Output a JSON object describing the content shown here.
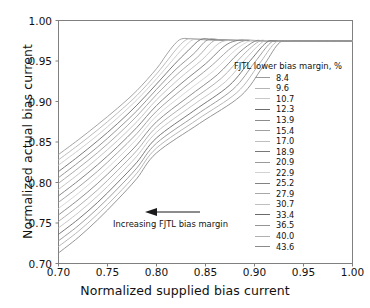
{
  "chart_data": {
    "type": "line",
    "title": "",
    "xlabel": "Normalized supplied bias current",
    "ylabel": "Normalized actual bias current",
    "xlim": [
      0.7,
      1.0
    ],
    "ylim": [
      0.7,
      1.0
    ],
    "xticks": [
      "0.70",
      "0.75",
      "0.80",
      "0.85",
      "0.90",
      "0.95",
      "1.00"
    ],
    "yticks": [
      "0.70",
      "0.75",
      "0.80",
      "0.85",
      "0.90",
      "0.95",
      "1.00"
    ],
    "xtick_values": [
      0.7,
      0.75,
      0.8,
      0.85,
      0.9,
      0.95,
      1.0
    ],
    "ytick_values": [
      0.7,
      0.75,
      0.8,
      0.85,
      0.9,
      0.95,
      1.0
    ],
    "grid": false,
    "legend_position": "inside-right",
    "legend_title": "FJTL lower bias margin, %",
    "annotations": [
      {
        "text": "Increasing FJTL bias margin",
        "arrow": "left-arrow",
        "x": 0.835,
        "y": 0.762
      }
    ],
    "series": [
      {
        "name": "8.4",
        "color": "#9a9a9a",
        "x": [
          0.7,
          0.72,
          0.74,
          0.76,
          0.78,
          0.8,
          0.81,
          0.818,
          0.826,
          0.84,
          0.86,
          0.9,
          0.95,
          1.0
        ],
        "y": [
          0.8345,
          0.8525,
          0.8715,
          0.8915,
          0.9135,
          0.9405,
          0.9575,
          0.97,
          0.9775,
          0.9768,
          0.9757,
          0.9752,
          0.975,
          0.9748
        ]
      },
      {
        "name": "9.6",
        "color": "#b4b4b4",
        "x": [
          0.7,
          0.72,
          0.74,
          0.76,
          0.78,
          0.8,
          0.812,
          0.822,
          0.832,
          0.845,
          0.865,
          0.9,
          0.95,
          1.0
        ],
        "y": [
          0.828,
          0.846,
          0.865,
          0.8855,
          0.9075,
          0.934,
          0.952,
          0.967,
          0.9772,
          0.9768,
          0.9757,
          0.9752,
          0.975,
          0.9748
        ]
      },
      {
        "name": "10.7",
        "color": "#c8c8c8",
        "x": [
          0.7,
          0.72,
          0.74,
          0.76,
          0.78,
          0.8,
          0.815,
          0.827,
          0.838,
          0.852,
          0.87,
          0.905,
          0.95,
          1.0
        ],
        "y": [
          0.8215,
          0.8395,
          0.8585,
          0.8795,
          0.902,
          0.928,
          0.949,
          0.9655,
          0.9768,
          0.9766,
          0.9756,
          0.9752,
          0.975,
          0.9748
        ]
      },
      {
        "name": "12.3",
        "color": "#6e6e6e",
        "x": [
          0.7,
          0.72,
          0.74,
          0.76,
          0.78,
          0.8,
          0.818,
          0.832,
          0.845,
          0.858,
          0.875,
          0.908,
          0.95,
          1.0
        ],
        "y": [
          0.8135,
          0.832,
          0.8515,
          0.8725,
          0.8955,
          0.9215,
          0.9455,
          0.9625,
          0.9765,
          0.9764,
          0.9755,
          0.9751,
          0.975,
          0.9748
        ]
      },
      {
        "name": "13.9",
        "color": "#8c8c8c",
        "x": [
          0.7,
          0.72,
          0.74,
          0.76,
          0.78,
          0.8,
          0.82,
          0.838,
          0.852,
          0.866,
          0.882,
          0.912,
          0.952,
          1.0
        ],
        "y": [
          0.806,
          0.8245,
          0.844,
          0.8655,
          0.8885,
          0.915,
          0.94,
          0.959,
          0.976,
          0.9762,
          0.9754,
          0.9751,
          0.975,
          0.9748
        ]
      },
      {
        "name": "15.4",
        "color": "#a0a0a0",
        "x": [
          0.7,
          0.72,
          0.74,
          0.76,
          0.78,
          0.8,
          0.822,
          0.842,
          0.858,
          0.872,
          0.888,
          0.916,
          0.955,
          1.0
        ],
        "y": [
          0.799,
          0.8175,
          0.837,
          0.8585,
          0.882,
          0.9085,
          0.9345,
          0.955,
          0.9745,
          0.976,
          0.9754,
          0.9751,
          0.975,
          0.9748
        ]
      },
      {
        "name": "17.0",
        "color": "#bebebe",
        "x": [
          0.7,
          0.72,
          0.74,
          0.76,
          0.78,
          0.8,
          0.824,
          0.846,
          0.864,
          0.878,
          0.894,
          0.92,
          0.958,
          1.0
        ],
        "y": [
          0.7915,
          0.81,
          0.83,
          0.8515,
          0.875,
          0.902,
          0.929,
          0.951,
          0.972,
          0.9757,
          0.9753,
          0.9751,
          0.975,
          0.9748
        ]
      },
      {
        "name": "18.9",
        "color": "#787878",
        "x": [
          0.7,
          0.72,
          0.74,
          0.76,
          0.78,
          0.8,
          0.826,
          0.85,
          0.87,
          0.884,
          0.898,
          0.924,
          0.96,
          1.0
        ],
        "y": [
          0.7835,
          0.802,
          0.822,
          0.844,
          0.868,
          0.895,
          0.923,
          0.9465,
          0.969,
          0.9756,
          0.9753,
          0.9751,
          0.975,
          0.9748
        ]
      },
      {
        "name": "20.9",
        "color": "#9a9a9a",
        "x": [
          0.7,
          0.72,
          0.74,
          0.76,
          0.78,
          0.8,
          0.828,
          0.854,
          0.876,
          0.89,
          0.902,
          0.928,
          0.962,
          1.0
        ],
        "y": [
          0.7755,
          0.794,
          0.814,
          0.8365,
          0.8605,
          0.888,
          0.917,
          0.942,
          0.966,
          0.9752,
          0.9752,
          0.975,
          0.975,
          0.9748
        ]
      },
      {
        "name": "22.9",
        "color": "#d2d2d2",
        "x": [
          0.7,
          0.72,
          0.74,
          0.76,
          0.78,
          0.8,
          0.83,
          0.858,
          0.88,
          0.895,
          0.906,
          0.932,
          0.965,
          1.0
        ],
        "y": [
          0.768,
          0.7865,
          0.807,
          0.8295,
          0.854,
          0.882,
          0.9115,
          0.9375,
          0.963,
          0.9748,
          0.9751,
          0.975,
          0.975,
          0.9748
        ]
      },
      {
        "name": "25.2",
        "color": "#828282",
        "x": [
          0.7,
          0.72,
          0.74,
          0.76,
          0.78,
          0.8,
          0.832,
          0.862,
          0.884,
          0.9,
          0.91,
          0.936,
          0.968,
          1.0
        ],
        "y": [
          0.76,
          0.7785,
          0.799,
          0.822,
          0.8465,
          0.875,
          0.9055,
          0.933,
          0.96,
          0.9742,
          0.975,
          0.9749,
          0.9749,
          0.9748
        ]
      },
      {
        "name": "27.9",
        "color": "#a8a8a8",
        "x": [
          0.7,
          0.72,
          0.74,
          0.76,
          0.78,
          0.8,
          0.834,
          0.866,
          0.888,
          0.904,
          0.914,
          0.94,
          0.97,
          1.0
        ],
        "y": [
          0.752,
          0.7705,
          0.791,
          0.8145,
          0.8395,
          0.8685,
          0.9,
          0.9285,
          0.957,
          0.9738,
          0.9752,
          0.9749,
          0.9749,
          0.9748
        ]
      },
      {
        "name": "30.7",
        "color": "#c0c0c0",
        "x": [
          0.7,
          0.72,
          0.74,
          0.76,
          0.78,
          0.8,
          0.836,
          0.87,
          0.892,
          0.908,
          0.918,
          0.944,
          0.972,
          1.0
        ],
        "y": [
          0.744,
          0.7625,
          0.7835,
          0.807,
          0.8325,
          0.862,
          0.8945,
          0.924,
          0.954,
          0.9732,
          0.975,
          0.9749,
          0.9749,
          0.9748
        ]
      },
      {
        "name": "33.4",
        "color": "#6a6a6a",
        "x": [
          0.7,
          0.72,
          0.74,
          0.76,
          0.78,
          0.8,
          0.838,
          0.874,
          0.896,
          0.912,
          0.922,
          0.948,
          0.975,
          1.0
        ],
        "y": [
          0.736,
          0.7545,
          0.7755,
          0.7995,
          0.825,
          0.855,
          0.8885,
          0.9195,
          0.951,
          0.9726,
          0.9749,
          0.9748,
          0.9748,
          0.9748
        ]
      },
      {
        "name": "36.5",
        "color": "#949494",
        "x": [
          0.7,
          0.72,
          0.74,
          0.76,
          0.78,
          0.8,
          0.84,
          0.878,
          0.9,
          0.916,
          0.926,
          0.952,
          0.977,
          1.0
        ],
        "y": [
          0.728,
          0.7465,
          0.768,
          0.792,
          0.818,
          0.8485,
          0.883,
          0.915,
          0.948,
          0.972,
          0.9748,
          0.9748,
          0.9748,
          0.9748
        ]
      },
      {
        "name": "40.0",
        "color": "#b0b0b0",
        "x": [
          0.7,
          0.72,
          0.74,
          0.76,
          0.78,
          0.8,
          0.842,
          0.882,
          0.904,
          0.92,
          0.93,
          0.956,
          0.98,
          1.0
        ],
        "y": [
          0.721,
          0.7395,
          0.761,
          0.785,
          0.8115,
          0.8425,
          0.878,
          0.911,
          0.945,
          0.9714,
          0.9747,
          0.9747,
          0.9748,
          0.9748
        ]
      },
      {
        "name": "43.6",
        "color": "#8a8a8a",
        "x": [
          0.7,
          0.72,
          0.74,
          0.76,
          0.78,
          0.8,
          0.844,
          0.886,
          0.908,
          0.924,
          0.934,
          0.96,
          0.982,
          1.0
        ],
        "y": [
          0.713,
          0.732,
          0.754,
          0.7785,
          0.805,
          0.8365,
          0.873,
          0.907,
          0.942,
          0.9708,
          0.9746,
          0.9747,
          0.9748,
          0.9748
        ]
      }
    ]
  },
  "legend": {
    "title": "FJTL lower bias margin, %",
    "entries": [
      {
        "label": "8.4",
        "color": "#9a9a9a"
      },
      {
        "label": "9.6",
        "color": "#b4b4b4"
      },
      {
        "label": "10.7",
        "color": "#c8c8c8"
      },
      {
        "label": "12.3",
        "color": "#6e6e6e"
      },
      {
        "label": "13.9",
        "color": "#8c8c8c"
      },
      {
        "label": "15.4",
        "color": "#a0a0a0"
      },
      {
        "label": "17.0",
        "color": "#bebebe"
      },
      {
        "label": "18.9",
        "color": "#787878"
      },
      {
        "label": "20.9",
        "color": "#9a9a9a"
      },
      {
        "label": "22.9",
        "color": "#d2d2d2"
      },
      {
        "label": "25.2",
        "color": "#828282"
      },
      {
        "label": "27.9",
        "color": "#a8a8a8"
      },
      {
        "label": "30.7",
        "color": "#c0c0c0"
      },
      {
        "label": "33.4",
        "color": "#6a6a6a"
      },
      {
        "label": "36.5",
        "color": "#949494"
      },
      {
        "label": "40.0",
        "color": "#b0b0b0"
      },
      {
        "label": "43.6",
        "color": "#8a8a8a"
      }
    ]
  },
  "annotation": {
    "text": "Increasing FJTL bias margin",
    "arrow_icon": "left-arrow-icon"
  },
  "axes": {
    "xlabel": "Normalized supplied bias current",
    "ylabel": "Normalized actual bias current",
    "xticks": [
      "0.70",
      "0.75",
      "0.80",
      "0.85",
      "0.90",
      "0.95",
      "1.00"
    ],
    "yticks": [
      "0.70",
      "0.75",
      "0.80",
      "0.85",
      "0.90",
      "0.95",
      "1.00"
    ]
  },
  "style": {
    "axis_color": "#808080",
    "text_color": "#111111",
    "background": "#ffffff"
  }
}
